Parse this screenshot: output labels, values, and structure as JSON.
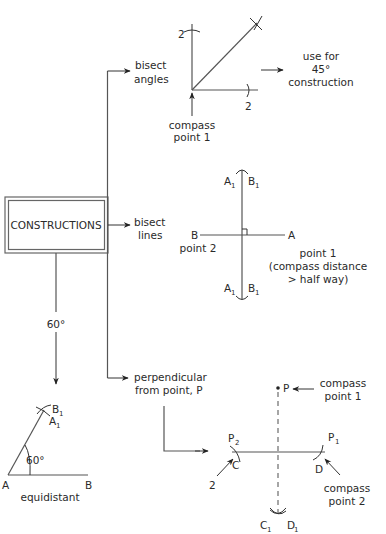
{
  "central": {
    "label": "CONSTRUCTIONS"
  },
  "branches": {
    "bisect_angles": {
      "label_line1": "bisect",
      "label_line2": "angles",
      "arc_label_top": "2",
      "arc_label_right": "2",
      "compass_line1": "compass",
      "compass_line2": "point 1",
      "note_line1": "use for",
      "note_line2": "45°",
      "note_line3": "construction"
    },
    "bisect_lines": {
      "label_line1": "bisect",
      "label_line2": "lines",
      "top_a": "A",
      "top_b": "B",
      "bottom_a": "A",
      "bottom_b": "B",
      "sub": "1",
      "point_b": "B",
      "point_a": "A",
      "point2": "point 2",
      "point1_line1": "point 1",
      "point1_line2": "(compass distance",
      "point1_line3": "> half way)"
    },
    "sixty": {
      "branch_label": "60°",
      "angle_label": "60°",
      "vertex_a": "A",
      "vertex_b": "B",
      "apex_b": "B",
      "apex_a": "A",
      "sub": "1",
      "caption": "equidistant"
    },
    "perpendicular": {
      "label_line1": "perpendicular",
      "label_line2": "from point, P",
      "point_p": "P",
      "compass1_line1": "compass",
      "compass1_line2": "point 1",
      "p2": "P",
      "p1": "P",
      "sub2": "2",
      "sub1": "1",
      "c": "C",
      "d": "D",
      "two": "2",
      "c1": "C",
      "d1": "D",
      "compass2_line1": "compass",
      "compass2_line2": "point 2"
    }
  }
}
